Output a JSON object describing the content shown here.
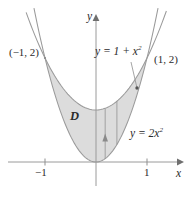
{
  "figure": {
    "background_color": "#ffffff",
    "curve_color": "#8c8c8c",
    "axis_color": "#8c8c8c",
    "shade_color": "#dcdcdc",
    "text_color": "#2b2b2b"
  },
  "axes": {
    "x_label": "x",
    "y_label": "y",
    "x_ticks": [
      {
        "value": -1,
        "label": "−1"
      },
      {
        "value": 1,
        "label": "1"
      }
    ],
    "y_ticks": [],
    "origin_px": {
      "x": 96,
      "y": 162
    },
    "scale_px_per_unit": {
      "x": 51,
      "y": 52
    },
    "x_range": [
      -1.75,
      1.68
    ],
    "y_range": [
      -0.62,
      2.9
    ],
    "grid": false
  },
  "labels": {
    "point_left": "(−1, 2)",
    "point_right": "(1, 2)",
    "region": "D",
    "curve_upper_prefix": "y = 1 + x",
    "curve_upper_exp": "2",
    "curve_lower_prefix": "y = 2x",
    "curve_lower_exp": "2"
  },
  "chart_data": {
    "type": "line",
    "title": "",
    "xlabel": "x",
    "ylabel": "y",
    "xlim": [
      -1.75,
      1.68
    ],
    "ylim": [
      -0.62,
      2.9
    ],
    "grid": false,
    "legend": "none",
    "series": [
      {
        "name": "y = 1 + x^2",
        "equation": "y = 1 + x^2",
        "label": "y = 1 + x²",
        "vertex": [
          0,
          1
        ],
        "leader_from_px": [
          131,
          62
        ],
        "leader_to_px": [
          137,
          88
        ]
      },
      {
        "name": "y = 2x^2",
        "equation": "y = 2x^2",
        "label": "y = 2x²",
        "vertex": [
          0,
          0
        ]
      }
    ],
    "intersections": [
      {
        "x": -1,
        "y": 2,
        "label": "(−1, 2)"
      },
      {
        "x": 1,
        "y": 2,
        "label": "(1, 2)"
      }
    ],
    "shaded_region": {
      "name": "D",
      "label": "D",
      "between": [
        "y = 2x^2",
        "y = 1 + x^2"
      ],
      "x_from": -1,
      "x_to": 1,
      "fill": "#dcdcdc"
    },
    "annotations": [
      {
        "type": "vertical-strip-arrow",
        "x": 0.18,
        "y_from": 0.065,
        "y_to": 1.032,
        "direction": "up"
      },
      {
        "type": "vertical-strip-edge",
        "x": 0.41,
        "y_from": 0.336,
        "y_to": 1.168
      }
    ]
  }
}
